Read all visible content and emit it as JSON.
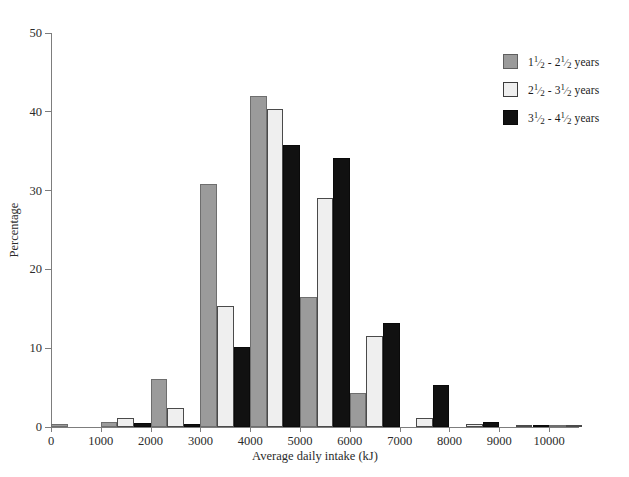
{
  "chart_data": {
    "type": "bar",
    "title": "",
    "subtitle": "",
    "xlabel": "Average daily intake (kJ)",
    "ylabel": "Percentage",
    "xlim": [
      0,
      10600
    ],
    "ylim": [
      0,
      50
    ],
    "xticks": [
      0,
      1000,
      2000,
      3000,
      4000,
      5000,
      6000,
      7000,
      8000,
      9000,
      10000
    ],
    "xticklabels": [
      "0",
      "1000",
      "2000",
      "3000",
      "4000",
      "5000",
      "6000",
      "7000",
      "8000",
      "9000",
      "10000"
    ],
    "yticks": [
      0,
      10,
      20,
      30,
      40,
      50
    ],
    "yticklabels": [
      "0",
      "10",
      "20",
      "30",
      "40",
      "50"
    ],
    "grid": false,
    "legend_position": "top-right",
    "bin_width": 1000,
    "bin_starts": [
      0,
      1000,
      2000,
      3000,
      4000,
      5000,
      6000,
      7000,
      8000,
      9000,
      10000
    ],
    "bin_labels": [
      "0-1000",
      "1000-2000",
      "2000-3000",
      "3000-4000",
      "4000-5000",
      "5000-6000",
      "6000-7000",
      "7000-8000",
      "8000-9000",
      "9000-10000",
      "10000-11000"
    ],
    "series": [
      {
        "name": "1½ - 2½ years",
        "color": "#9b9b9b",
        "values": [
          0.4,
          0.6,
          6.1,
          30.8,
          42.0,
          16.5,
          4.3,
          0.0,
          0.0,
          0.0,
          0.3
        ]
      },
      {
        "name": "2½ - 3½ years",
        "color": "#efefef",
        "values": [
          0.0,
          1.1,
          2.4,
          15.4,
          40.3,
          29.0,
          11.6,
          1.2,
          0.4,
          0.2,
          0.3
        ]
      },
      {
        "name": "3½ - 4½ years",
        "color": "#111111",
        "values": [
          0.0,
          0.5,
          0.4,
          10.2,
          35.8,
          34.1,
          13.2,
          5.3,
          0.6,
          0.2,
          0.0
        ]
      }
    ]
  },
  "legend": {
    "entries": [
      {
        "lo_int": "1",
        "lo_num": "1",
        "lo_den": "2",
        "hi_int": "2",
        "hi_num": "1",
        "hi_den": "2",
        "unit": "years"
      },
      {
        "lo_int": "2",
        "lo_num": "1",
        "lo_den": "2",
        "hi_int": "3",
        "hi_num": "1",
        "hi_den": "2",
        "unit": "years"
      },
      {
        "lo_int": "3",
        "lo_num": "1",
        "lo_den": "2",
        "hi_int": "4",
        "hi_num": "1",
        "hi_den": "2",
        "unit": "years"
      }
    ],
    "dash": "-"
  }
}
